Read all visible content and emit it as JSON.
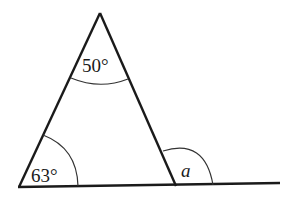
{
  "diagram": {
    "angles": {
      "apex": "50°",
      "bottom_left": "63°",
      "exterior": "a"
    },
    "colors": {
      "stroke": "#1a1a1a",
      "background": "#ffffff"
    }
  }
}
